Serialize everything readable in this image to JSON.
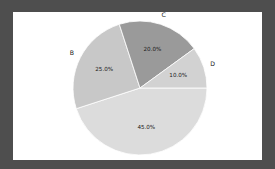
{
  "figure": {
    "background_color": "#4e4e4e",
    "panel_color": "#ffffff"
  },
  "chart_data": {
    "type": "pie",
    "title": "",
    "xlabel": "",
    "ylabel": "",
    "categories": [
      "A",
      "B",
      "C",
      "D"
    ],
    "values": [
      45.0,
      25.0,
      20.0,
      10.0
    ],
    "value_labels": [
      "45.0%",
      "25.0%",
      "20.0%",
      "10.0%"
    ],
    "colors": [
      "#dcdcdc",
      "#c8c8c8",
      "#9a9a9a",
      "#d2d2d2"
    ],
    "start_angle_deg": 90,
    "direction": "clockwise",
    "legend": "none",
    "grid": false,
    "label_placement": "outside",
    "autopct_placement": "inside",
    "slices": [
      {
        "category": "A",
        "value": 45.0,
        "value_label": "45.0%",
        "color": "#dcdcdc",
        "start_deg": 198,
        "sweep_deg": 162
      },
      {
        "category": "B",
        "value": 25.0,
        "value_label": "25.0%",
        "color": "#c8c8c8",
        "start_deg": 108,
        "sweep_deg": 90
      },
      {
        "category": "C",
        "value": 20.0,
        "value_label": "20.0%",
        "color": "#9a9a9a",
        "start_deg": 36,
        "sweep_deg": 72
      },
      {
        "category": "D",
        "value": 10.0,
        "value_label": "10.0%",
        "color": "#d2d2d2",
        "start_deg": 0,
        "sweep_deg": 36
      }
    ]
  }
}
